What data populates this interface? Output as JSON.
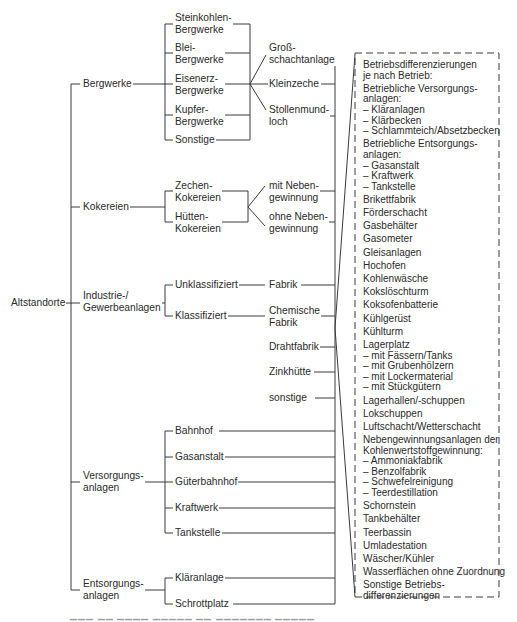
{
  "root": "Altstandorte",
  "level1": {
    "bergwerke": "Bergwerke",
    "kokereien": "Kokereien",
    "industrie": [
      "Industrie-/",
      "Gewerbeanlagen"
    ],
    "versorgung": [
      "Versorgungs-",
      "anlagen"
    ],
    "entsorgung": [
      "Entsorgungs-",
      "anlagen"
    ]
  },
  "bergwerke_types": [
    [
      "Steinkohlen-",
      "Bergwerke"
    ],
    [
      "Blei-",
      "Bergwerke"
    ],
    [
      "Eisenerz-",
      "Bergwerke"
    ],
    [
      "Kupfer-",
      "Bergwerke"
    ],
    [
      "Sonstige"
    ]
  ],
  "bergwerke_sub": [
    [
      "Groß-",
      "schachtanlage"
    ],
    [
      "Kleinzeche"
    ],
    [
      "Stollenmund-",
      "loch"
    ]
  ],
  "kokereien_types": [
    [
      "Zechen-",
      "Kokereien"
    ],
    [
      "Hütten-",
      "Kokereien"
    ]
  ],
  "kokereien_sub": [
    [
      "mit Neben-",
      "gewinnung"
    ],
    [
      "ohne Neben-",
      "gewinnung"
    ]
  ],
  "industrie_types": [
    "Unklassifiziert",
    "Klassifiziert"
  ],
  "industrie_sub": [
    [
      "Fabrik"
    ],
    [
      "Chemische",
      "Fabrik"
    ],
    [
      "Drahtfabrik"
    ],
    [
      "Zinkhütte"
    ],
    [
      "sonstige"
    ]
  ],
  "versorgung_types": [
    "Bahnhof",
    "Gasanstalt",
    "Güterbahnhof",
    "Kraftwerk",
    "Tankstelle"
  ],
  "entsorgung_types": [
    "Kläranlage",
    "Schrottplatz"
  ],
  "betrieb_box": [
    {
      "text": "Betriebsdifferenzierungen",
      "sub": true
    },
    {
      "text": "je nach Betrieb:"
    },
    {
      "text": "Betriebliche Versorgungs-",
      "sub": true
    },
    {
      "text": "anlagen:",
      "sub": true
    },
    {
      "text": "– Kläranlagen",
      "sub": true
    },
    {
      "text": "– Klärbecken",
      "sub": true
    },
    {
      "text": "– Schlammteich/Absetzbecken"
    },
    {
      "text": "Betriebliche Entsorgungs-",
      "sub": true
    },
    {
      "text": "anlagen:",
      "sub": true
    },
    {
      "text": "– Gasanstalt",
      "sub": true
    },
    {
      "text": "– Kraftwerk",
      "sub": true
    },
    {
      "text": "– Tankstelle"
    },
    {
      "text": "Brikettfabrik"
    },
    {
      "text": "Förderschacht"
    },
    {
      "text": "Gasbehälter"
    },
    {
      "text": "Gasometer"
    },
    {
      "text": "Gleisanlagen"
    },
    {
      "text": "Hochofen"
    },
    {
      "text": "Kohlenwäsche"
    },
    {
      "text": "Kokslöschturm"
    },
    {
      "text": "Koksofenbatterie"
    },
    {
      "text": "Kühlgerüst"
    },
    {
      "text": "Kühlturm"
    },
    {
      "text": "Lagerplatz",
      "sub": true
    },
    {
      "text": "– mit Fässern/Tanks",
      "sub": true
    },
    {
      "text": "– mit Grubenhölzern",
      "sub": true
    },
    {
      "text": "– mit Lockermaterial",
      "sub": true
    },
    {
      "text": "– mit Stückgütern"
    },
    {
      "text": "Lagerhallen/-schuppen"
    },
    {
      "text": "Lokschuppen"
    },
    {
      "text": "Luftschacht/Wetterschacht"
    },
    {
      "text": "Nebengewinnungsanlagen der",
      "sub": true
    },
    {
      "text": "Kohlenwertstoffgewinnung:",
      "sub": true
    },
    {
      "text": "– Ammoniakfabrik",
      "sub": true
    },
    {
      "text": "– Benzolfabrik",
      "sub": true
    },
    {
      "text": "– Schwefelreinigung",
      "sub": true
    },
    {
      "text": "– Teerdestillation"
    },
    {
      "text": "Schornstein"
    },
    {
      "text": "Tankbehälter"
    },
    {
      "text": "Teerbassin"
    },
    {
      "text": "Umladestation"
    },
    {
      "text": "Wäscher/Kühler"
    },
    {
      "text": "Wasserflächen ohne Zuordnung"
    },
    {
      "text": "Sonstige Betriebs-",
      "sub": true
    },
    {
      "text": "differenzierungen"
    }
  ],
  "colors": {
    "line": "#3a3a3a",
    "text": "#2a2a2a",
    "background": "#ffffff"
  }
}
